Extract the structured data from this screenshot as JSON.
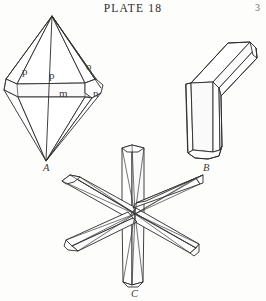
{
  "header": {
    "plate_title": "PLATE 18",
    "page_number": "3"
  },
  "figures": [
    {
      "id": "A",
      "caption": "A",
      "name": "bipyramid-crystal",
      "face_labels": [
        {
          "text": "p",
          "x": 22,
          "y": 66
        },
        {
          "text": "p",
          "x": 49,
          "y": 70
        },
        {
          "text": "o",
          "x": 86,
          "y": 61
        },
        {
          "text": "m",
          "x": 59,
          "y": 88
        },
        {
          "text": "n",
          "x": 93,
          "y": 88
        }
      ]
    },
    {
      "id": "B",
      "caption": "B",
      "name": "knee-twin-crystal",
      "face_labels": []
    },
    {
      "id": "C",
      "caption": "C",
      "name": "six-rayed-star-twin-crystal",
      "face_labels": []
    }
  ],
  "colors": {
    "ink": "#2a2a2a",
    "label_ink": "#3b3b3b",
    "paper": "#fdfdfb"
  }
}
